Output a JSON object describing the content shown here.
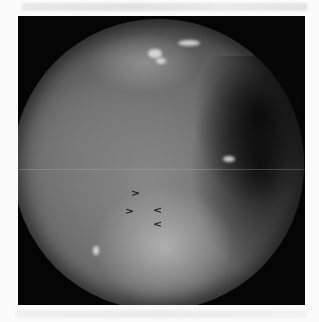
{
  "figure": {
    "type": "endoscopic-grayscale-photograph",
    "annotations": {
      "arrowheads": [
        {
          "glyph": ">",
          "direction": "right",
          "x": 131,
          "y": 188
        },
        {
          "glyph": ">",
          "direction": "right",
          "x": 125,
          "y": 206
        },
        {
          "glyph": "<",
          "direction": "left",
          "x": 153,
          "y": 205
        },
        {
          "glyph": "<",
          "direction": "left",
          "x": 153,
          "y": 219
        }
      ]
    },
    "colors": {
      "background": "#fbfbfb",
      "frame": "#050505",
      "tissue_mid": "#7a7a7a",
      "arrowhead": "#111111"
    }
  }
}
